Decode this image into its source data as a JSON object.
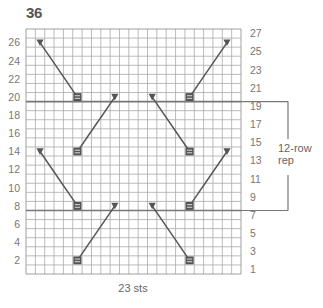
{
  "chart": {
    "title": "36",
    "stitch_count_label": "23 sts",
    "repeat_label_line1": "12-row",
    "repeat_label_line2": "rep",
    "columns": 23,
    "rows": 27,
    "left_axis_labels": [
      "2",
      "4",
      "6",
      "8",
      "10",
      "12",
      "14",
      "16",
      "18",
      "20",
      "22",
      "24",
      "26"
    ],
    "right_axis_labels": [
      "1",
      "3",
      "5",
      "7",
      "9",
      "11",
      "13",
      "15",
      "17",
      "19",
      "21",
      "23",
      "25",
      "27"
    ],
    "repeat_rows": {
      "from": 8,
      "to": 19
    },
    "colors": {
      "grid": "#aaaaaa",
      "border": "#888888",
      "heavy_line": "#777777",
      "symbol": "#555555",
      "cable_line": "#555555"
    },
    "symbols": [
      {
        "type": "triangle-down",
        "row": 26,
        "col": 2
      },
      {
        "type": "triangle-down",
        "row": 26,
        "col": 22
      },
      {
        "type": "box-equals",
        "row": 20,
        "col": 6
      },
      {
        "type": "triangle-down",
        "row": 20,
        "col": 10
      },
      {
        "type": "triangle-down",
        "row": 20,
        "col": 14
      },
      {
        "type": "box-equals",
        "row": 20,
        "col": 18
      },
      {
        "type": "triangle-down",
        "row": 14,
        "col": 2
      },
      {
        "type": "box-equals",
        "row": 14,
        "col": 6
      },
      {
        "type": "box-equals",
        "row": 14,
        "col": 18
      },
      {
        "type": "triangle-down",
        "row": 14,
        "col": 22
      },
      {
        "type": "box-equals",
        "row": 8,
        "col": 6
      },
      {
        "type": "triangle-down",
        "row": 8,
        "col": 10
      },
      {
        "type": "triangle-down",
        "row": 8,
        "col": 14
      },
      {
        "type": "box-equals",
        "row": 8,
        "col": 18
      },
      {
        "type": "box-equals",
        "row": 2,
        "col": 6
      },
      {
        "type": "box-equals",
        "row": 2,
        "col": 18
      }
    ],
    "lines": [
      {
        "from": {
          "row": 26,
          "col": 2
        },
        "to": {
          "row": 20,
          "col": 6
        }
      },
      {
        "from": {
          "row": 26,
          "col": 22
        },
        "to": {
          "row": 20,
          "col": 18
        }
      },
      {
        "from": {
          "row": 20,
          "col": 10
        },
        "to": {
          "row": 14,
          "col": 6
        }
      },
      {
        "from": {
          "row": 20,
          "col": 14
        },
        "to": {
          "row": 14,
          "col": 18
        }
      },
      {
        "from": {
          "row": 14,
          "col": 2
        },
        "to": {
          "row": 8,
          "col": 6
        }
      },
      {
        "from": {
          "row": 14,
          "col": 22
        },
        "to": {
          "row": 8,
          "col": 18
        }
      },
      {
        "from": {
          "row": 8,
          "col": 10
        },
        "to": {
          "row": 2,
          "col": 6
        }
      },
      {
        "from": {
          "row": 8,
          "col": 14
        },
        "to": {
          "row": 2,
          "col": 18
        }
      }
    ]
  }
}
